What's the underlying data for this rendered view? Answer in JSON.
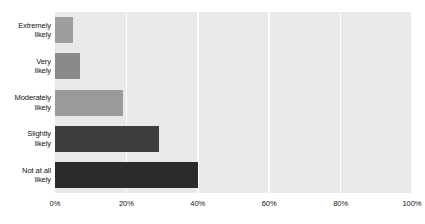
{
  "chart_data": {
    "type": "bar",
    "orientation": "horizontal",
    "title": "",
    "subtitle": "",
    "xlabel": "",
    "ylabel": "",
    "categories": [
      "Extremely\nlikely",
      "Very\nlikely",
      "Moderately\nlikely",
      "Slightly\nlikely",
      "Not at all\nlikely"
    ],
    "values": [
      5,
      7,
      19,
      29,
      40
    ],
    "value_suffix": "%",
    "bar_colors": [
      "#9e9e9e",
      "#8a8a8a",
      "#9a9a9a",
      "#3d3d3d",
      "#2b2b2b"
    ],
    "xlim": [
      0,
      100
    ],
    "xticks": [
      0,
      20,
      40,
      60,
      80,
      100
    ],
    "xtick_labels": [
      "0%",
      "20%",
      "40%",
      "60%",
      "80%",
      "100%"
    ],
    "grid": true,
    "grid_axis": "x",
    "grid_color": "#fdfdfd",
    "plot_background": "#e9e9e9",
    "page_background": "#ffffff",
    "legend": null,
    "annotations": []
  },
  "axes": {
    "y_categories": [
      {
        "line1": "Extremely",
        "line2": "likely"
      },
      {
        "line1": "Very",
        "line2": "likely"
      },
      {
        "line1": "Moderately",
        "line2": "likely"
      },
      {
        "line1": "Slightly",
        "line2": "likely"
      },
      {
        "line1": "Not at all",
        "line2": "likely"
      }
    ],
    "x_ticks": [
      "0%",
      "20%",
      "40%",
      "60%",
      "80%",
      "100%"
    ]
  }
}
